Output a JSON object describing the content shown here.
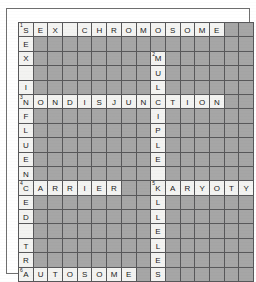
{
  "puzzle": {
    "title": "Genetics Crossword Puzzle",
    "type": "crossword-grid",
    "columns": 16,
    "rows": 18,
    "colors": {
      "blocked_cell": "#a6a6a6",
      "open_cell": "#f3f3f1",
      "grid_line": "#58585a",
      "letter": "#1b1b1b",
      "page": "#ffffff"
    },
    "entries": [
      {
        "number": 1,
        "direction": "across",
        "row": 0,
        "col": 0,
        "answer": "SEX"
      },
      {
        "number": 1,
        "direction": "down",
        "row": 0,
        "col": 0,
        "answer": "SEXINFLUENCED"
      },
      {
        "number": 1,
        "direction": "across",
        "row": 0,
        "col": 4,
        "answer": "CHROMOSOME"
      },
      {
        "number": 2,
        "direction": "down",
        "row": 2,
        "col": 9,
        "answer": "MULTIPLE"
      },
      {
        "number": 3,
        "direction": "across",
        "row": 5,
        "col": 0,
        "answer": "NONDISJUNCTION"
      },
      {
        "number": 4,
        "direction": "across",
        "row": 11,
        "col": 0,
        "answer": "CARRIER"
      },
      {
        "number": 5,
        "direction": "across",
        "row": 11,
        "col": 9,
        "answer": "KARYOTYPE"
      },
      {
        "number": 5,
        "direction": "down",
        "row": 11,
        "col": 9,
        "answer": "KALLELES"
      },
      {
        "number": 6,
        "direction": "across",
        "row": 16,
        "col": 0,
        "answer": "AUTOSOME"
      }
    ],
    "cells": [
      [
        {
          "l": "S",
          "n": "1"
        },
        {
          "l": "E"
        },
        {
          "l": "X"
        },
        {
          "l": ""
        },
        {
          "l": "C"
        },
        {
          "l": "H"
        },
        {
          "l": "R"
        },
        {
          "l": "O"
        },
        {
          "l": "M"
        },
        {
          "l": "O"
        },
        {
          "l": "S"
        },
        {
          "l": "O"
        },
        {
          "l": "M"
        },
        {
          "l": "E"
        },
        null,
        null
      ],
      [
        {
          "l": "E"
        },
        null,
        null,
        null,
        null,
        null,
        null,
        null,
        null,
        null,
        null,
        null,
        null,
        null,
        null,
        null
      ],
      [
        {
          "l": "X"
        },
        null,
        null,
        null,
        null,
        null,
        null,
        null,
        null,
        {
          "l": "M",
          "n": "2"
        },
        null,
        null,
        null,
        null,
        null,
        null
      ],
      [
        {
          "l": ""
        },
        null,
        null,
        null,
        null,
        null,
        null,
        null,
        null,
        {
          "l": "U"
        },
        null,
        null,
        null,
        null,
        null,
        null
      ],
      [
        {
          "l": "I"
        },
        null,
        null,
        null,
        null,
        null,
        null,
        null,
        null,
        {
          "l": "L"
        },
        null,
        null,
        null,
        null,
        null,
        null
      ],
      [
        {
          "l": "N",
          "n": "3"
        },
        {
          "l": "O"
        },
        {
          "l": "N"
        },
        {
          "l": "D"
        },
        {
          "l": "I"
        },
        {
          "l": "S"
        },
        {
          "l": "J"
        },
        {
          "l": "U"
        },
        {
          "l": "N"
        },
        {
          "l": "C"
        },
        {
          "l": "T"
        },
        {
          "l": "I"
        },
        {
          "l": "O"
        },
        {
          "l": "N"
        },
        null,
        null
      ],
      [
        {
          "l": "F"
        },
        null,
        null,
        null,
        null,
        null,
        null,
        null,
        null,
        {
          "l": "I"
        },
        null,
        null,
        null,
        null,
        null,
        null
      ],
      [
        {
          "l": "L"
        },
        null,
        null,
        null,
        null,
        null,
        null,
        null,
        null,
        {
          "l": "P"
        },
        null,
        null,
        null,
        null,
        null,
        null
      ],
      [
        {
          "l": "U"
        },
        null,
        null,
        null,
        null,
        null,
        null,
        null,
        null,
        {
          "l": "L"
        },
        null,
        null,
        null,
        null,
        null,
        null
      ],
      [
        {
          "l": "E"
        },
        null,
        null,
        null,
        null,
        null,
        null,
        null,
        null,
        {
          "l": "E"
        },
        null,
        null,
        null,
        null,
        null,
        null
      ],
      [
        {
          "l": "N"
        },
        null,
        null,
        null,
        null,
        null,
        null,
        null,
        null,
        {
          "l": ""
        },
        null,
        null,
        null,
        null,
        null,
        null
      ],
      [
        {
          "l": "C",
          "n": "4"
        },
        {
          "l": "A"
        },
        {
          "l": "R"
        },
        {
          "l": "R"
        },
        {
          "l": "I"
        },
        {
          "l": "E"
        },
        {
          "l": "R"
        },
        null,
        null,
        {
          "l": "K",
          "n": "5"
        },
        {
          "l": "A"
        },
        {
          "l": "R"
        },
        {
          "l": "Y"
        },
        {
          "l": "O"
        },
        {
          "l": "T"
        },
        {
          "l": "Y"
        }
      ],
      [
        {
          "l": "E"
        },
        null,
        null,
        null,
        null,
        null,
        null,
        null,
        null,
        {
          "l": "L"
        },
        null,
        null,
        null,
        null,
        null,
        null
      ],
      [
        {
          "l": "D"
        },
        null,
        null,
        null,
        null,
        null,
        null,
        null,
        null,
        {
          "l": "L"
        },
        null,
        null,
        null,
        null,
        null,
        null
      ],
      [
        {
          "l": ""
        },
        null,
        null,
        null,
        null,
        null,
        null,
        null,
        null,
        {
          "l": "E"
        },
        null,
        null,
        null,
        null,
        null,
        null
      ],
      [
        {
          "l": "T"
        },
        null,
        null,
        null,
        null,
        null,
        null,
        null,
        null,
        {
          "l": "L"
        },
        null,
        null,
        null,
        null,
        null,
        null
      ],
      [
        {
          "l": "R"
        },
        null,
        null,
        null,
        null,
        null,
        null,
        null,
        null,
        {
          "l": "E"
        },
        null,
        null,
        null,
        null,
        null,
        null
      ],
      [
        {
          "l": "A",
          "n": "6"
        },
        {
          "l": "U"
        },
        {
          "l": "T"
        },
        {
          "l": "O"
        },
        {
          "l": "S"
        },
        {
          "l": "O"
        },
        {
          "l": "M"
        },
        {
          "l": "E"
        },
        null,
        {
          "l": "S"
        },
        null,
        null,
        null,
        null,
        null,
        null
      ]
    ],
    "overflow_row_11": [
      {
        "l": "P"
      },
      {
        "l": "E"
      }
    ],
    "overflow_row_0": [],
    "tail_rows": [
      {
        "row": 18,
        "cells": [
          {
            "l": "I"
          }
        ]
      },
      {
        "row": 19,
        "cells": [
          {
            "l": "T"
          }
        ]
      }
    ]
  }
}
